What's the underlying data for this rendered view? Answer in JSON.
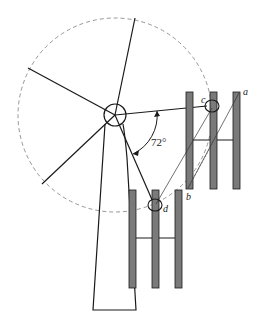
{
  "diagram": {
    "type": "wind-turbine-blade-geometry",
    "labels": {
      "a": "a",
      "b": "b",
      "c": "c",
      "d": "d",
      "angle": "72°"
    },
    "colors": {
      "stroke": "#1a1a1a",
      "bar_fill": "#7a7a7a",
      "dashed": "#8a8a8a",
      "background": "#ffffff"
    },
    "geometry": {
      "hub": {
        "cx": 115,
        "cy": 115,
        "r": 11
      },
      "rotor_circle": {
        "cx": 115,
        "cy": 115,
        "r": 97
      },
      "blade_count": 5,
      "blade_angle_deg": 72
    }
  }
}
